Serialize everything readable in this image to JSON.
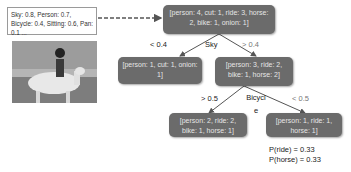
{
  "features_box": {
    "text": "Sky: 0.8, Person: 0.7, Bicycle: 0.4, Sitting: 0.6, Pan: 0.1 ..."
  },
  "image": {
    "description": "person riding a white horse on a beach"
  },
  "tree": {
    "root": {
      "text": "[person: 4, cut: 1, ride: 3, horse: 2, bike: 1, onion: 1]",
      "split_feature": "Sky"
    },
    "root_edges": {
      "left": "< 0.4",
      "right": "> 0.4"
    },
    "left_child": {
      "text": "[person: 1, cut: 1, onion: 1]"
    },
    "right_child": {
      "text": "[person: 3, ride: 2, bike: 1, horse: 2]",
      "split_feature": "Bicycl e"
    },
    "right_edges": {
      "left": "> 0.5",
      "right": "< 0.5"
    },
    "rl_leaf": {
      "text": "[person: 2, ride: 2, bike: 1, horse: 1]"
    },
    "rr_leaf": {
      "text": "[person: 1, ride: 1, horse: 1]"
    }
  },
  "probabilities": [
    "P(ride) = 0.33",
    "P(horse) = 0.33"
  ]
}
